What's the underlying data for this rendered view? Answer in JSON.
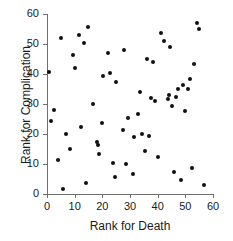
{
  "chart_data": {
    "type": "scatter",
    "title": "",
    "xlabel": "Rank for Death",
    "ylabel": "Rank for Complication",
    "xlim": [
      0,
      60
    ],
    "ylim": [
      0,
      60
    ],
    "xticks": [
      0,
      10,
      20,
      30,
      40,
      50,
      60
    ],
    "yticks": [
      0,
      10,
      20,
      30,
      40,
      50,
      60
    ],
    "xtick_labels": [
      "0",
      "10",
      "20",
      "30",
      "40",
      "50",
      "60"
    ],
    "ytick_labels": [
      "0",
      "10",
      "20",
      "30",
      "40",
      "50",
      "60"
    ],
    "grid": false,
    "legend": null,
    "marker": {
      "shape": "circle",
      "color": "#111111",
      "size": 4
    },
    "axis_color": "#6f6f6f",
    "background": "#ffffff",
    "n_points": 60,
    "points": [
      {
        "x": 0.6,
        "y": 40.8
      },
      {
        "x": 1.5,
        "y": 24.3
      },
      {
        "x": 2.4,
        "y": 27.9
      },
      {
        "x": 4.1,
        "y": 11.3
      },
      {
        "x": 5.2,
        "y": 52.0
      },
      {
        "x": 5.9,
        "y": 1.8
      },
      {
        "x": 6.8,
        "y": 20.1
      },
      {
        "x": 8.3,
        "y": 15.1
      },
      {
        "x": 9.4,
        "y": 46.2
      },
      {
        "x": 10.2,
        "y": 42.1
      },
      {
        "x": 11.6,
        "y": 53.1
      },
      {
        "x": 12.4,
        "y": 22.4
      },
      {
        "x": 13.2,
        "y": 50.2
      },
      {
        "x": 14.1,
        "y": 3.6
      },
      {
        "x": 14.8,
        "y": 55.7
      },
      {
        "x": 16.6,
        "y": 30.1
      },
      {
        "x": 17.9,
        "y": 17.3
      },
      {
        "x": 18.3,
        "y": 16.4
      },
      {
        "x": 18.9,
        "y": 13.4
      },
      {
        "x": 19.7,
        "y": 23.6
      },
      {
        "x": 20.4,
        "y": 39.2
      },
      {
        "x": 21.9,
        "y": 47.0
      },
      {
        "x": 22.6,
        "y": 40.3
      },
      {
        "x": 23.9,
        "y": 10.4
      },
      {
        "x": 24.7,
        "y": 5.6
      },
      {
        "x": 25.1,
        "y": 37.3
      },
      {
        "x": 27.3,
        "y": 21.5
      },
      {
        "x": 27.9,
        "y": 48.0
      },
      {
        "x": 28.4,
        "y": 9.9
      },
      {
        "x": 29.2,
        "y": 25.3
      },
      {
        "x": 31.0,
        "y": 6.6
      },
      {
        "x": 31.4,
        "y": 18.9
      },
      {
        "x": 32.8,
        "y": 26.8
      },
      {
        "x": 33.6,
        "y": 34.1
      },
      {
        "x": 34.4,
        "y": 20.1
      },
      {
        "x": 35.6,
        "y": 14.5
      },
      {
        "x": 36.3,
        "y": 45.0
      },
      {
        "x": 36.9,
        "y": 19.5
      },
      {
        "x": 37.7,
        "y": 32.1
      },
      {
        "x": 38.2,
        "y": 44.1
      },
      {
        "x": 39.1,
        "y": 30.9
      },
      {
        "x": 40.3,
        "y": 12.3
      },
      {
        "x": 41.2,
        "y": 53.7
      },
      {
        "x": 42.4,
        "y": 50.9
      },
      {
        "x": 43.6,
        "y": 31.6
      },
      {
        "x": 44.1,
        "y": 33.0
      },
      {
        "x": 44.6,
        "y": 48.9
      },
      {
        "x": 45.2,
        "y": 29.5
      },
      {
        "x": 45.9,
        "y": 7.5
      },
      {
        "x": 46.8,
        "y": 32.3
      },
      {
        "x": 47.5,
        "y": 35.1
      },
      {
        "x": 48.3,
        "y": 4.7
      },
      {
        "x": 49.1,
        "y": 36.4
      },
      {
        "x": 49.8,
        "y": 27.6
      },
      {
        "x": 50.9,
        "y": 35.0
      },
      {
        "x": 51.8,
        "y": 38.4
      },
      {
        "x": 52.4,
        "y": 8.8
      },
      {
        "x": 53.3,
        "y": 43.2
      },
      {
        "x": 54.1,
        "y": 57.0
      },
      {
        "x": 55.0,
        "y": 54.9
      },
      {
        "x": 56.6,
        "y": 3.0
      }
    ]
  }
}
